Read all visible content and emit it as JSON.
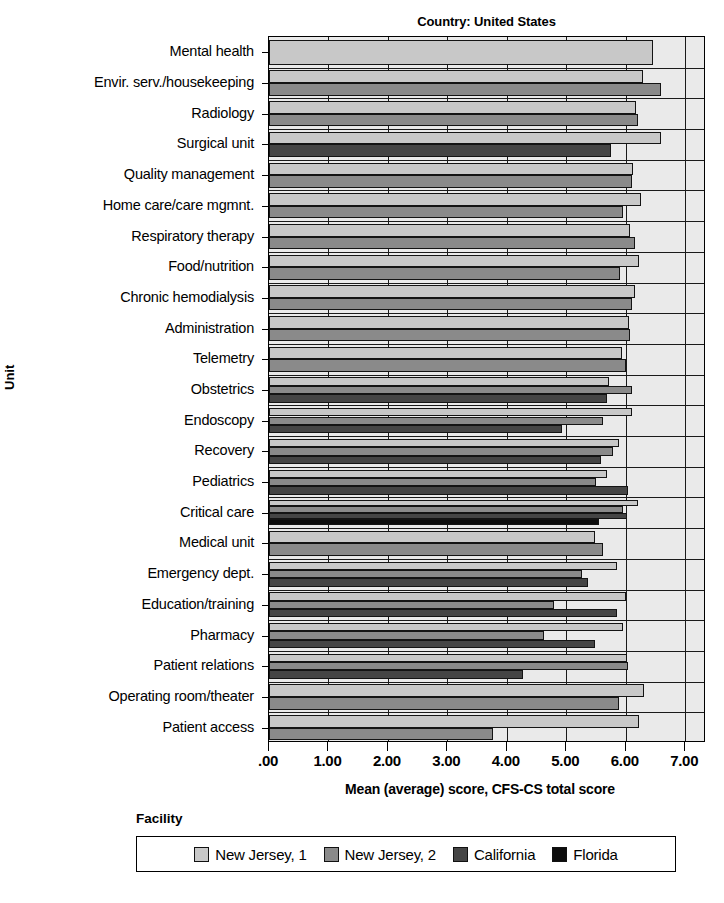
{
  "chart_data": {
    "type": "bar",
    "orientation": "horizontal",
    "title": "Country: United States",
    "xlabel": "Mean (average) score, CFS-CS total score",
    "ylabel": "Unit",
    "legend_title": "Facility",
    "legend_position": "bottom",
    "grid": true,
    "xlim": [
      0,
      7.35
    ],
    "xticks": [
      0,
      1,
      2,
      3,
      4,
      5,
      6,
      7
    ],
    "xtick_labels": [
      ".00",
      "1.00",
      "2.00",
      "3.00",
      "4.00",
      "5.00",
      "6.00",
      "7.00"
    ],
    "categories": [
      "Mental health",
      "Envir. serv./housekeeping",
      "Radiology",
      "Surgical unit",
      "Quality management",
      "Home care/care mgmnt.",
      "Respiratory therapy",
      "Food/nutrition",
      "Chronic hemodialysis",
      "Administration",
      "Telemetry",
      "Obstetrics",
      "Endoscopy",
      "Recovery",
      "Pediatrics",
      "Critical care",
      "Medical unit",
      "Emergency dept.",
      "Education/training",
      "Pharmacy",
      "Patient relations",
      "Operating room/theater",
      "Patient access"
    ],
    "series": [
      {
        "name": "New Jersey, 1",
        "color": "#c8c8c8",
        "values": [
          6.46,
          6.29,
          6.18,
          6.6,
          6.12,
          6.26,
          6.08,
          6.22,
          6.15,
          6.05,
          5.93,
          5.72,
          6.1,
          5.88,
          5.68,
          6.2,
          5.48,
          5.86,
          6.0,
          5.96,
          6.02,
          6.3,
          6.22
        ]
      },
      {
        "name": "New Jersey, 2",
        "color": "#8a8a8a",
        "values": [
          null,
          6.59,
          6.2,
          null,
          6.11,
          5.95,
          6.16,
          5.91,
          6.1,
          6.08,
          6.0,
          6.11,
          5.62,
          5.78,
          5.5,
          5.95,
          5.62,
          5.26,
          4.8,
          4.62,
          6.03,
          5.88,
          3.76
        ]
      },
      {
        "name": "California",
        "color": "#454545",
        "values": [
          null,
          null,
          null,
          5.75,
          null,
          null,
          null,
          null,
          null,
          null,
          null,
          5.68,
          4.92,
          5.58,
          6.03,
          6.02,
          null,
          5.36,
          5.85,
          5.48,
          4.28,
          null,
          null
        ]
      },
      {
        "name": "Florida",
        "color": "#0d0d0d",
        "values": [
          null,
          null,
          null,
          null,
          null,
          null,
          null,
          null,
          null,
          null,
          null,
          null,
          null,
          null,
          null,
          5.55,
          null,
          null,
          null,
          null,
          null,
          null,
          null
        ]
      }
    ]
  },
  "legend": {
    "title": "Facility",
    "entries": [
      {
        "label": "New Jersey, 1",
        "color": "#c8c8c8"
      },
      {
        "label": "New Jersey, 2",
        "color": "#8a8a8a"
      },
      {
        "label": "California",
        "color": "#454545"
      },
      {
        "label": "Florida",
        "color": "#0d0d0d"
      }
    ]
  },
  "scan_artifact_text": ""
}
